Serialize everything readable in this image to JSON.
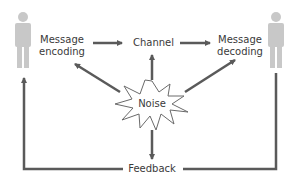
{
  "diagram": {
    "title": "",
    "type": "communication-process-model",
    "colors": {
      "arrow": "#5a5a5a",
      "person": "#c8c8c8",
      "text": "#3a3a3a",
      "noise_outline": "#6a6a6a",
      "background": "#ffffff"
    },
    "nodes": {
      "sender": {
        "label": "",
        "icon": "person-icon"
      },
      "encoding": {
        "line1": "Message",
        "line2": "encoding"
      },
      "channel": {
        "label": "Channel"
      },
      "decoding": {
        "line1": "Message",
        "line2": "decoding"
      },
      "receiver": {
        "label": "",
        "icon": "person-icon"
      },
      "noise": {
        "label": "Noise",
        "icon": "starburst-icon"
      },
      "feedback": {
        "label": "Feedback"
      }
    },
    "edges": [
      {
        "from": "encoding",
        "to": "channel"
      },
      {
        "from": "channel",
        "to": "decoding"
      },
      {
        "from": "noise",
        "to": "encoding"
      },
      {
        "from": "noise",
        "to": "channel"
      },
      {
        "from": "noise",
        "to": "decoding"
      },
      {
        "from": "noise",
        "to": "feedback"
      },
      {
        "from": "receiver",
        "to": "feedback"
      },
      {
        "from": "feedback",
        "to": "sender"
      }
    ]
  }
}
